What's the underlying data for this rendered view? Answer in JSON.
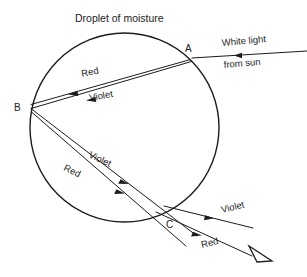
{
  "figure": {
    "title": "Droplet of moisture",
    "type": "optics-ray-diagram",
    "background_color": "#ffffff",
    "line_color": "#1c1c1c"
  },
  "droplet": {
    "shape": "circle",
    "center_x": 124.5,
    "center_y": 127.5,
    "radius": 94.5
  },
  "points": [
    {
      "id": "A",
      "label": "A",
      "x": 192,
      "y": 58,
      "label_x": 190,
      "label_y": 49,
      "role": "entry-refraction-point"
    },
    {
      "id": "B",
      "label": "B",
      "x": 31,
      "y": 107,
      "label_x": 19,
      "label_y": 110,
      "role": "internal-reflection-point"
    },
    {
      "id": "C",
      "label": "C",
      "x": 172,
      "y": 214,
      "label_x": 170,
      "label_y": 226,
      "role": "exit-refraction-point"
    }
  ],
  "rays": {
    "incoming": {
      "label_line1": "White light",
      "label_line2": "from sun",
      "label1_x": 252,
      "label1_y": 47,
      "label2_x": 248,
      "label2_y": 68,
      "from_x": 307,
      "from_y": 51,
      "to_x": 192,
      "to_y": 58
    },
    "segment_a_to_b": [
      {
        "color_name": "Red",
        "label": "Red",
        "label_x": 95,
        "label_y": 76,
        "rotation": -12
      },
      {
        "color_name": "Violet",
        "label": "Violet",
        "label_x": 100,
        "label_y": 99,
        "rotation": -10
      }
    ],
    "segment_b_to_c": [
      {
        "color_name": "Violet",
        "label": "Violet",
        "label_x": 100,
        "label_y": 158,
        "rotation": 25
      },
      {
        "color_name": "Red",
        "label": "Red",
        "label_x": 78,
        "label_y": 172,
        "rotation": 25
      }
    ],
    "exiting": [
      {
        "color_name": "Violet",
        "label": "Violet",
        "label_x": 232,
        "label_y": 211,
        "rotation": -14
      },
      {
        "color_name": "Red",
        "label": "Red",
        "label_x": 214,
        "label_y": 246,
        "rotation": -14
      }
    ]
  },
  "observer": {
    "symbol": "eye-triangle",
    "x": 250,
    "y": 246
  }
}
